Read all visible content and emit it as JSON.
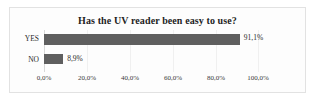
{
  "chart_data": {
    "type": "bar",
    "orientation": "horizontal",
    "title": "Has the UV reader been easy to use?",
    "xlabel": "",
    "ylabel": "",
    "categories": [
      "YES",
      "NO"
    ],
    "values": [
      91.1,
      8.9
    ],
    "value_labels": [
      "91,1%",
      "8,9%"
    ],
    "xlim": [
      0,
      100
    ],
    "xticks": [
      0,
      20,
      40,
      60,
      80,
      100
    ],
    "xtick_labels": [
      "0,0%",
      "20,0%",
      "40,0%",
      "60,0%",
      "80,0%",
      "100,0%"
    ],
    "grid": true,
    "legend": "none",
    "bar_color": "#5f5f5f",
    "background_color": "#fdfdfd",
    "border_color": "#e2e2e2",
    "text_color": "#2a2a2a"
  }
}
